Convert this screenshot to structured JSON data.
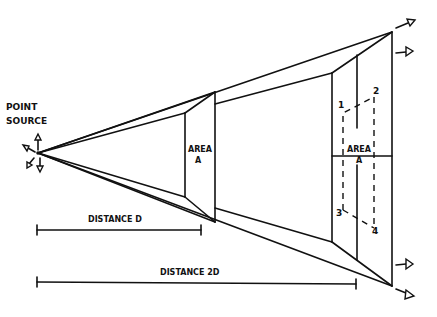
{
  "diagram": {
    "labels": {
      "point_source_line1": "POINT",
      "point_source_line2": "SOURCE",
      "area_near_line1": "AREA",
      "area_near_line2": "A",
      "area_far_line1": "AREA",
      "area_far_line2": "A",
      "corner_1": "1",
      "corner_2": "2",
      "corner_3": "3",
      "corner_4": "4",
      "distance_d": "DISTANCE D",
      "distance_2d": "DISTANCE 2D"
    },
    "colors": {
      "ink": "#111111",
      "paper": "#ffffff"
    }
  }
}
